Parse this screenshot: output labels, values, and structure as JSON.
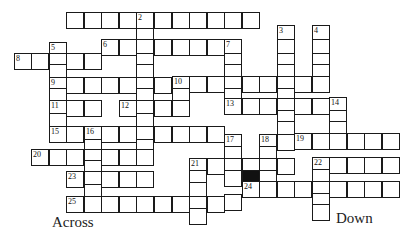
{
  "puzzle": {
    "type": "crossword",
    "headings": {
      "across": "Across",
      "down": "Down"
    },
    "cell_size": {
      "w": 17.6,
      "h": 16.5
    },
    "cells": [
      {
        "x": 66,
        "y": 12
      },
      {
        "x": 84,
        "y": 12
      },
      {
        "x": 101,
        "y": 12
      },
      {
        "x": 119,
        "y": 12
      },
      {
        "x": 136,
        "y": 12,
        "n": "2"
      },
      {
        "x": 154,
        "y": 12
      },
      {
        "x": 172,
        "y": 12
      },
      {
        "x": 189,
        "y": 12
      },
      {
        "x": 207,
        "y": 12
      },
      {
        "x": 224,
        "y": 12
      },
      {
        "x": 242,
        "y": 12
      },
      {
        "x": 136,
        "y": 28
      },
      {
        "x": 277,
        "y": 25,
        "n": "3"
      },
      {
        "x": 312,
        "y": 25,
        "n": "4"
      },
      {
        "x": 277,
        "y": 39
      },
      {
        "x": 312,
        "y": 39
      },
      {
        "x": 101,
        "y": 39,
        "n": "6"
      },
      {
        "x": 119,
        "y": 39
      },
      {
        "x": 136,
        "y": 39
      },
      {
        "x": 154,
        "y": 39
      },
      {
        "x": 172,
        "y": 39
      },
      {
        "x": 189,
        "y": 39
      },
      {
        "x": 207,
        "y": 39
      },
      {
        "x": 224,
        "y": 39,
        "n": "7"
      },
      {
        "x": 49,
        "y": 42,
        "n": "5"
      },
      {
        "x": 14,
        "y": 53,
        "n": "8"
      },
      {
        "x": 31,
        "y": 53
      },
      {
        "x": 49,
        "y": 53
      },
      {
        "x": 66,
        "y": 53
      },
      {
        "x": 84,
        "y": 53
      },
      {
        "x": 136,
        "y": 53
      },
      {
        "x": 224,
        "y": 53
      },
      {
        "x": 277,
        "y": 53
      },
      {
        "x": 312,
        "y": 53
      },
      {
        "x": 49,
        "y": 64
      },
      {
        "x": 136,
        "y": 64
      },
      {
        "x": 224,
        "y": 64
      },
      {
        "x": 277,
        "y": 64
      },
      {
        "x": 312,
        "y": 64
      },
      {
        "x": 49,
        "y": 77,
        "n": "9"
      },
      {
        "x": 66,
        "y": 77
      },
      {
        "x": 84,
        "y": 77
      },
      {
        "x": 101,
        "y": 77
      },
      {
        "x": 119,
        "y": 77
      },
      {
        "x": 136,
        "y": 77
      },
      {
        "x": 154,
        "y": 77
      },
      {
        "x": 172,
        "y": 76,
        "n": "10"
      },
      {
        "x": 189,
        "y": 76
      },
      {
        "x": 207,
        "y": 76
      },
      {
        "x": 224,
        "y": 76
      },
      {
        "x": 242,
        "y": 76
      },
      {
        "x": 259,
        "y": 76
      },
      {
        "x": 277,
        "y": 76
      },
      {
        "x": 294,
        "y": 76
      },
      {
        "x": 312,
        "y": 76
      },
      {
        "x": 49,
        "y": 88
      },
      {
        "x": 136,
        "y": 88
      },
      {
        "x": 172,
        "y": 88
      },
      {
        "x": 224,
        "y": 88
      },
      {
        "x": 277,
        "y": 88
      },
      {
        "x": 49,
        "y": 100,
        "n": "11"
      },
      {
        "x": 66,
        "y": 100
      },
      {
        "x": 84,
        "y": 100
      },
      {
        "x": 119,
        "y": 100,
        "n": "12"
      },
      {
        "x": 136,
        "y": 100
      },
      {
        "x": 154,
        "y": 100
      },
      {
        "x": 172,
        "y": 100
      },
      {
        "x": 224,
        "y": 98,
        "n": "13"
      },
      {
        "x": 242,
        "y": 98
      },
      {
        "x": 259,
        "y": 98
      },
      {
        "x": 277,
        "y": 98
      },
      {
        "x": 294,
        "y": 98
      },
      {
        "x": 312,
        "y": 98
      },
      {
        "x": 329,
        "y": 97,
        "n": "14"
      },
      {
        "x": 49,
        "y": 113
      },
      {
        "x": 136,
        "y": 113
      },
      {
        "x": 277,
        "y": 110
      },
      {
        "x": 329,
        "y": 110
      },
      {
        "x": 49,
        "y": 126,
        "n": "15"
      },
      {
        "x": 66,
        "y": 126
      },
      {
        "x": 84,
        "y": 126,
        "n": "16"
      },
      {
        "x": 101,
        "y": 126
      },
      {
        "x": 119,
        "y": 126
      },
      {
        "x": 136,
        "y": 126
      },
      {
        "x": 154,
        "y": 126
      },
      {
        "x": 172,
        "y": 126
      },
      {
        "x": 189,
        "y": 126
      },
      {
        "x": 207,
        "y": 126
      },
      {
        "x": 277,
        "y": 121
      },
      {
        "x": 329,
        "y": 121
      },
      {
        "x": 224,
        "y": 134,
        "n": "17"
      },
      {
        "x": 259,
        "y": 134,
        "n": "18"
      },
      {
        "x": 277,
        "y": 134
      },
      {
        "x": 294,
        "y": 133,
        "n": "19"
      },
      {
        "x": 312,
        "y": 133
      },
      {
        "x": 329,
        "y": 133
      },
      {
        "x": 347,
        "y": 133
      },
      {
        "x": 364,
        "y": 133
      },
      {
        "x": 382,
        "y": 133
      },
      {
        "x": 84,
        "y": 139
      },
      {
        "x": 136,
        "y": 139
      },
      {
        "x": 31,
        "y": 149,
        "n": "20"
      },
      {
        "x": 49,
        "y": 149
      },
      {
        "x": 66,
        "y": 149
      },
      {
        "x": 84,
        "y": 149
      },
      {
        "x": 101,
        "y": 149
      },
      {
        "x": 119,
        "y": 149
      },
      {
        "x": 136,
        "y": 149
      },
      {
        "x": 224,
        "y": 146
      },
      {
        "x": 259,
        "y": 146
      },
      {
        "x": 189,
        "y": 158,
        "n": "21"
      },
      {
        "x": 207,
        "y": 158
      },
      {
        "x": 224,
        "y": 158
      },
      {
        "x": 242,
        "y": 158
      },
      {
        "x": 259,
        "y": 158
      },
      {
        "x": 277,
        "y": 158
      },
      {
        "x": 312,
        "y": 157,
        "n": "22"
      },
      {
        "x": 329,
        "y": 157
      },
      {
        "x": 347,
        "y": 157
      },
      {
        "x": 364,
        "y": 157
      },
      {
        "x": 382,
        "y": 157
      },
      {
        "x": 84,
        "y": 160
      },
      {
        "x": 66,
        "y": 171,
        "n": "23"
      },
      {
        "x": 84,
        "y": 171
      },
      {
        "x": 101,
        "y": 171
      },
      {
        "x": 119,
        "y": 171
      },
      {
        "x": 136,
        "y": 171
      },
      {
        "x": 189,
        "y": 170
      },
      {
        "x": 224,
        "y": 170
      },
      {
        "x": 242,
        "y": 170,
        "black": true
      },
      {
        "x": 259,
        "y": 170
      },
      {
        "x": 312,
        "y": 169
      },
      {
        "x": 84,
        "y": 184
      },
      {
        "x": 189,
        "y": 182
      },
      {
        "x": 242,
        "y": 181,
        "n": "24"
      },
      {
        "x": 259,
        "y": 181
      },
      {
        "x": 277,
        "y": 181
      },
      {
        "x": 294,
        "y": 181
      },
      {
        "x": 312,
        "y": 181
      },
      {
        "x": 329,
        "y": 181
      },
      {
        "x": 347,
        "y": 181
      },
      {
        "x": 364,
        "y": 181
      },
      {
        "x": 382,
        "y": 181
      },
      {
        "x": 312,
        "y": 193
      },
      {
        "x": 66,
        "y": 196,
        "n": "25"
      },
      {
        "x": 84,
        "y": 196
      },
      {
        "x": 101,
        "y": 196
      },
      {
        "x": 119,
        "y": 196
      },
      {
        "x": 136,
        "y": 196
      },
      {
        "x": 154,
        "y": 196
      },
      {
        "x": 172,
        "y": 196
      },
      {
        "x": 189,
        "y": 196
      },
      {
        "x": 207,
        "y": 196
      },
      {
        "x": 224,
        "y": 194
      },
      {
        "x": 189,
        "y": 208
      },
      {
        "x": 312,
        "y": 204
      }
    ]
  }
}
